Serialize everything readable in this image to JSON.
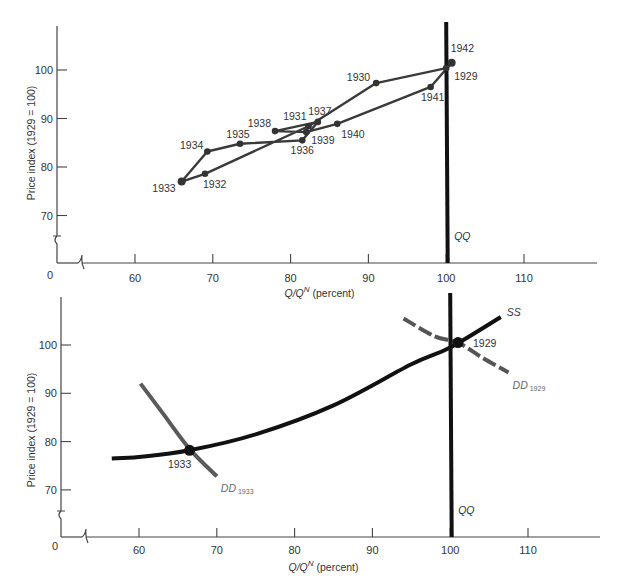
{
  "chart_data": [
    {
      "type": "line",
      "title": "",
      "xlabel": "Q/Q^N (percent)",
      "xlabel_main": "Q/Q",
      "xlabel_sup": "N",
      "xlabel_unit": "(percent)",
      "ylabel": "Price index (1929 = 100)",
      "xlim": [
        55,
        118
      ],
      "ylim": [
        65,
        108
      ],
      "origin_label": "0",
      "x_ticks": [
        60,
        70,
        80,
        90,
        100,
        110
      ],
      "y_ticks": [
        70,
        80,
        90,
        100
      ],
      "axis_break": true,
      "grid": false,
      "series": [
        {
          "name": "Actual price vs output 1929-1942",
          "points": [
            {
              "label": "1929",
              "x": 100.0,
              "y": 100.4
            },
            {
              "label": "1930",
              "x": 91.0,
              "y": 97.3
            },
            {
              "label": "1931",
              "x": 82.3,
              "y": 88.4
            },
            {
              "label": "1932",
              "x": 69.0,
              "y": 78.6
            },
            {
              "label": "1933",
              "x": 66.0,
              "y": 77.0
            },
            {
              "label": "1934",
              "x": 69.3,
              "y": 83.2
            },
            {
              "label": "1935",
              "x": 73.5,
              "y": 84.8
            },
            {
              "label": "1936",
              "x": 81.5,
              "y": 85.5
            },
            {
              "label": "1937",
              "x": 83.5,
              "y": 89.3
            },
            {
              "label": "1938",
              "x": 78.0,
              "y": 87.4
            },
            {
              "label": "1939",
              "x": 82.0,
              "y": 87.2
            },
            {
              "label": "1940",
              "x": 86.0,
              "y": 88.9
            },
            {
              "label": "1941",
              "x": 98.0,
              "y": 96.5
            },
            {
              "label": "1942",
              "x": 100.7,
              "y": 101.5
            }
          ]
        },
        {
          "name": "QQ",
          "type": "vertical_line",
          "x": 100,
          "label": "QQ"
        }
      ]
    },
    {
      "type": "line",
      "title": "",
      "xlabel": "Q/Q^N (percent)",
      "xlabel_main": "Q/Q",
      "xlabel_sup": "N",
      "xlabel_unit": "(percent)",
      "ylabel": "Price index (1929 = 100)",
      "xlim": [
        55,
        118
      ],
      "ylim": [
        65,
        108
      ],
      "origin_label": "0",
      "x_ticks": [
        60,
        70,
        80,
        90,
        100,
        110
      ],
      "y_ticks": [
        70,
        80,
        90,
        100
      ],
      "axis_break": true,
      "grid": false,
      "series": [
        {
          "name": "SS",
          "label": "SS",
          "style": "solid-thick",
          "points": [
            [
              56.5,
              76.5
            ],
            [
              60,
              76.8
            ],
            [
              66.5,
              78.2
            ],
            [
              75,
              81.5
            ],
            [
              85,
              87.5
            ],
            [
              95,
              96
            ],
            [
              100,
              99.5
            ],
            [
              106.5,
              105.8
            ]
          ]
        },
        {
          "name": "DD1933",
          "label_main": "DD",
          "label_sub": "1933",
          "style": "solid-gray",
          "points": [
            [
              60.2,
              92
            ],
            [
              63,
              86
            ],
            [
              66.5,
              78.5
            ],
            [
              70,
              72.8
            ]
          ]
        },
        {
          "name": "DD1929",
          "label_main": "DD",
          "label_sub": "1929",
          "style": "dashed-gray",
          "points": [
            [
              94,
              105.5
            ],
            [
              98,
              101.8
            ],
            [
              101,
              100.5
            ],
            [
              104,
              97.5
            ],
            [
              107.5,
              94.3
            ]
          ]
        },
        {
          "name": "QQ",
          "type": "vertical_line",
          "x": 100,
          "label": "QQ"
        }
      ],
      "equilibria": [
        {
          "label": "1933",
          "x": 66.5,
          "y": 78.2
        },
        {
          "label": "1929",
          "x": 101,
          "y": 100.5
        }
      ]
    }
  ]
}
